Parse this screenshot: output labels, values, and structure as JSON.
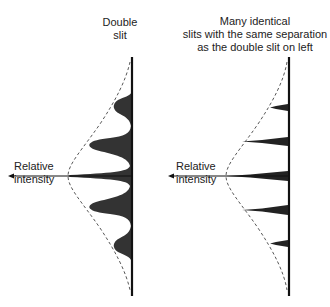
{
  "left_panel": {
    "title_line1": "Double",
    "title_line2": "slit",
    "axis_label_line1": "Relative",
    "axis_label_line2": "intensity"
  },
  "right_panel": {
    "title_line1": "Many identical",
    "title_line2": "slits with the same separation",
    "title_line3": "as the double slit on left",
    "axis_label_line1": "Relative",
    "axis_label_line2": "intensity"
  },
  "colors": {
    "fill": "#333333",
    "line": "#111111",
    "envelope": "#444444"
  }
}
